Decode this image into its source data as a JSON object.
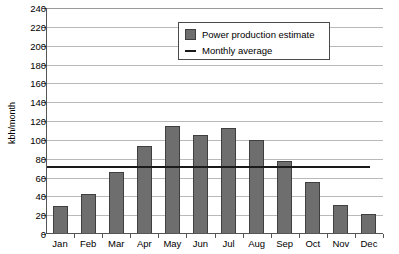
{
  "chart_data": {
    "type": "bar",
    "title": "",
    "subtitle": "",
    "xlabel": "",
    "ylabel": "kbh/month",
    "categories": [
      "Jan",
      "Feb",
      "Mar",
      "Apr",
      "May",
      "Jun",
      "Jul",
      "Aug",
      "Sep",
      "Oct",
      "Nov",
      "Dec"
    ],
    "series": [
      {
        "name": "Power production estimate",
        "type": "bar",
        "color": "#6e6e6e",
        "values": [
          30,
          43,
          66,
          93,
          115,
          105,
          113,
          100,
          78,
          55,
          31,
          21
        ]
      },
      {
        "name": "Monthly average",
        "type": "line",
        "color": "#1a1a1a",
        "value": 71
      }
    ],
    "ylim": [
      0,
      240
    ],
    "ytick_step": 20,
    "yticks": [
      0,
      20,
      40,
      60,
      80,
      100,
      120,
      140,
      160,
      180,
      200,
      220,
      240
    ],
    "ytick_labels": [
      "0",
      "20",
      "40",
      "60",
      "80",
      "100",
      "120",
      "140",
      "160",
      "180",
      "200",
      "220",
      "240"
    ],
    "grid": true,
    "grid_axis": "y",
    "legend_position": "top-center",
    "legend_entries": [
      {
        "label": "Power production estimate",
        "marker": "square-swatch",
        "color": "#6e6e6e"
      },
      {
        "label": "Monthly average",
        "marker": "line-swatch",
        "color": "#1a1a1a"
      }
    ],
    "background_color": "#ffffff",
    "gridline_color": "#b9b9b9",
    "axis_color": "#555555"
  }
}
